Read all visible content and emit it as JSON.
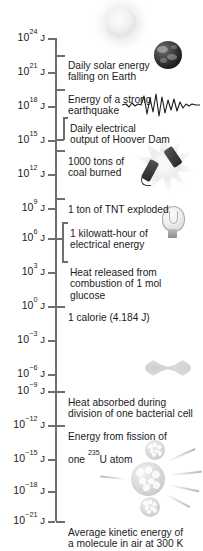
{
  "figure": {
    "type": "logarithmic-energy-scale",
    "unit": "J",
    "axis": {
      "orientation": "vertical",
      "scale": "log10",
      "top_exponent": 24,
      "bottom_exponent": -21,
      "step": 3
    }
  },
  "ticks": [
    {
      "mantissa": "10",
      "exponent": "24",
      "unit": "J",
      "y": 38
    },
    {
      "mantissa": "10",
      "exponent": "21",
      "unit": "J",
      "y": 72
    },
    {
      "mantissa": "10",
      "exponent": "18",
      "unit": "J",
      "y": 106
    },
    {
      "mantissa": "10",
      "exponent": "15",
      "unit": "J",
      "y": 140
    },
    {
      "mantissa": "10",
      "exponent": "12",
      "unit": "J",
      "y": 174
    },
    {
      "mantissa": "10",
      "exponent": "9",
      "unit": "J",
      "y": 208
    },
    {
      "mantissa": "10",
      "exponent": "6",
      "unit": "J",
      "y": 238
    },
    {
      "mantissa": "10",
      "exponent": "3",
      "unit": "J",
      "y": 272
    },
    {
      "mantissa": "10",
      "exponent": "0",
      "unit": "J",
      "y": 306
    },
    {
      "mantissa": "10",
      "exponent": "−3",
      "unit": "J",
      "y": 340
    },
    {
      "mantissa": "10",
      "exponent": "−6",
      "unit": "J",
      "y": 374
    },
    {
      "mantissa": "10",
      "exponent": "−9",
      "unit": "J",
      "y": 391
    },
    {
      "mantissa": "10",
      "exponent": "−12",
      "unit": "J",
      "y": 425
    },
    {
      "mantissa": "10",
      "exponent": "−15",
      "unit": "J",
      "y": 459
    },
    {
      "mantissa": "10",
      "exponent": "−18",
      "unit": "J",
      "y": 491
    },
    {
      "mantissa": "10",
      "exponent": "−21",
      "unit": "J",
      "y": 521
    }
  ],
  "callouts": [
    {
      "id": "solar",
      "line1": "Daily solar energy",
      "line2": "falling on Earth"
    },
    {
      "id": "earthquake",
      "line1": "Energy of a strong",
      "line2": "earthquake"
    },
    {
      "id": "hoover",
      "line1": "Daily electrical",
      "line2": "output of Hoover Dam"
    },
    {
      "id": "coal",
      "line1": "1000 tons of",
      "line2": "coal burned"
    },
    {
      "id": "tnt",
      "line1": "1 ton of TNT exploded",
      "line2": ""
    },
    {
      "id": "kwh",
      "line1": "1 kilowatt-hour of",
      "line2": "electrical energy"
    },
    {
      "id": "glucose",
      "line1": "Heat released from",
      "line2": "combustion of 1 mol",
      "line3": "glucose"
    },
    {
      "id": "calorie",
      "line1": "1 calorie (4.184 J)",
      "line2": ""
    },
    {
      "id": "bacteria",
      "line1": "Heat absorbed during",
      "line2": "division of one bacterial cell"
    },
    {
      "id": "fission",
      "line1": "Energy from fission of",
      "line2_pre": "one ",
      "line2_sup": "235",
      "line2_post": "U atom"
    },
    {
      "id": "kinetic",
      "line1": "Average kinetic energy of",
      "line2": "a molecule in air at 300 K"
    }
  ],
  "artwork": [
    {
      "name": "sun-illustration",
      "label": "sun"
    },
    {
      "name": "earth-illustration",
      "label": "earth"
    },
    {
      "name": "seismograph-trace",
      "label": "seismograph waveform"
    },
    {
      "name": "explosion-dynamite",
      "label": "exploding dynamite sticks"
    },
    {
      "name": "light-bulb-illustration",
      "label": "light bulb"
    },
    {
      "name": "dividing-cell-illustration",
      "label": "dividing bacterial cell"
    },
    {
      "name": "nuclear-fission-illustration",
      "label": "fissioning uranium nucleus"
    }
  ],
  "colors": {
    "axis": "#6e6e6e",
    "text": "#1b1b1b",
    "background": "#ffffff"
  }
}
